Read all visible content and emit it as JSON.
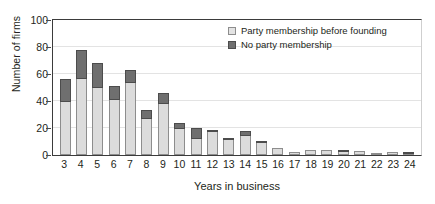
{
  "chart_data": {
    "type": "bar",
    "title": "",
    "xlabel": "Years in business",
    "ylabel": "Number of firms",
    "ylim": [
      0,
      100
    ],
    "yticks": [
      0,
      20,
      40,
      60,
      80,
      100
    ],
    "grid": true,
    "stacked": true,
    "legend_position": "top-right",
    "categories": [
      "3",
      "4",
      "5",
      "6",
      "7",
      "8",
      "9",
      "10",
      "11",
      "12",
      "13",
      "14",
      "15",
      "16",
      "17",
      "18",
      "19",
      "20",
      "21",
      "22",
      "23",
      "24"
    ],
    "series": [
      {
        "name": "Party membership before founding",
        "color": "#dcdcdc",
        "values": [
          39,
          56,
          50,
          41,
          53,
          27,
          38,
          19,
          12,
          17,
          11,
          14,
          9,
          5,
          2,
          4,
          4,
          2,
          3,
          1,
          2,
          1
        ]
      },
      {
        "name": "No party membership",
        "color": "#6f6f6f",
        "values": [
          17,
          22,
          18,
          10,
          10,
          6,
          8,
          5,
          8,
          1,
          1,
          4,
          1,
          0,
          0,
          0,
          0,
          1,
          0,
          0,
          0,
          1
        ]
      }
    ],
    "totals": [
      56,
      78,
      68,
      51,
      63,
      33,
      46,
      24,
      20,
      18,
      12,
      18,
      10,
      5,
      2,
      4,
      4,
      3,
      3,
      1,
      2,
      2
    ]
  },
  "axis": {
    "ylabel": "Number of firms",
    "xlabel": "Years in business",
    "ytick_labels": [
      "100",
      "80",
      "60",
      "40",
      "20",
      "0"
    ]
  },
  "legend": {
    "items": [
      {
        "label": "Party membership before founding",
        "swatch": "light-square-swatch"
      },
      {
        "label": "No party membership",
        "swatch": "dark-square-swatch"
      }
    ]
  }
}
